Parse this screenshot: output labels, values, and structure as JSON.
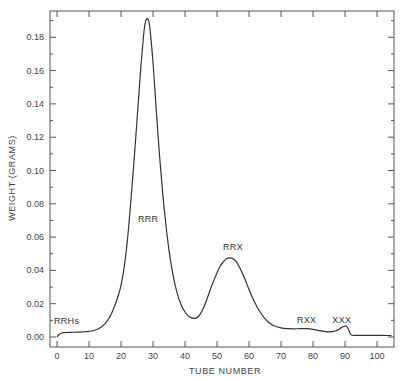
{
  "chart_data": {
    "type": "line",
    "title": "",
    "xlabel": "TUBE NUMBER",
    "ylabel": "WEIGHT (GRAMS)",
    "xlim": [
      -2,
      105
    ],
    "ylim": [
      -0.006,
      0.196
    ],
    "grid": false,
    "legend": null,
    "x_ticks": [
      0,
      10,
      20,
      30,
      40,
      50,
      60,
      70,
      80,
      90,
      100
    ],
    "x_tick_labels": [
      "0",
      "10",
      "20",
      "30",
      "40",
      "50",
      "60",
      "70",
      "80",
      "90",
      "100"
    ],
    "y_ticks": [
      0.0,
      0.02,
      0.04,
      0.06,
      0.08,
      0.1,
      0.12,
      0.14,
      0.16,
      0.18
    ],
    "y_tick_labels": [
      "0.00",
      "0.02",
      "0.04",
      "0.06",
      "0.08",
      "0.10",
      "0.12",
      "0.14",
      "0.16",
      "0.18"
    ],
    "series": [
      {
        "name": "weight",
        "x": [
          0,
          0.5,
          1,
          2,
          4,
          6,
          8,
          10,
          12,
          14,
          15,
          16,
          17,
          18,
          19,
          20,
          21,
          22,
          23,
          24,
          25,
          26,
          27,
          27.5,
          28,
          28.5,
          29,
          30,
          31,
          32,
          33,
          34,
          35,
          36,
          37,
          38,
          39,
          40,
          41,
          42,
          43,
          44,
          45,
          46,
          47,
          48,
          49,
          50,
          51,
          52,
          53,
          54,
          55,
          56,
          57,
          58,
          59,
          60,
          61,
          62,
          63,
          64,
          65,
          66,
          67,
          68,
          70,
          72,
          74,
          76,
          78,
          80,
          82,
          84,
          85,
          86,
          87,
          88,
          89,
          90,
          90.5,
          91,
          91.5,
          92,
          93,
          95,
          100,
          103,
          104.5
        ],
        "y": [
          0.0,
          0.0012,
          0.002,
          0.0026,
          0.0028,
          0.0029,
          0.0031,
          0.0034,
          0.0042,
          0.0062,
          0.008,
          0.0105,
          0.014,
          0.0185,
          0.024,
          0.031,
          0.042,
          0.058,
          0.08,
          0.104,
          0.13,
          0.157,
          0.18,
          0.188,
          0.191,
          0.1905,
          0.186,
          0.165,
          0.137,
          0.11,
          0.087,
          0.068,
          0.052,
          0.04,
          0.0305,
          0.0235,
          0.0185,
          0.015,
          0.0127,
          0.0115,
          0.0112,
          0.012,
          0.0145,
          0.0185,
          0.0235,
          0.029,
          0.034,
          0.0385,
          0.0425,
          0.0452,
          0.047,
          0.0475,
          0.047,
          0.0452,
          0.042,
          0.038,
          0.0335,
          0.0285,
          0.024,
          0.02,
          0.0165,
          0.0135,
          0.011,
          0.009,
          0.0076,
          0.0066,
          0.0055,
          0.005,
          0.0049,
          0.005,
          0.005,
          0.0046,
          0.0038,
          0.0032,
          0.0031,
          0.0032,
          0.0036,
          0.0045,
          0.0058,
          0.0066,
          0.0064,
          0.005,
          0.0025,
          0.0012,
          0.001,
          0.001,
          0.001,
          0.0009,
          0.0009
        ]
      }
    ],
    "annotations": [
      {
        "text": "RRHs",
        "x": 3,
        "y": 0.008
      },
      {
        "text": "RRR",
        "x": 28.5,
        "y": 0.069
      },
      {
        "text": "RRX",
        "x": 55,
        "y": 0.052
      },
      {
        "text": "RXX",
        "x": 78,
        "y": 0.0085
      },
      {
        "text": "XXX",
        "x": 89,
        "y": 0.0085
      }
    ]
  }
}
